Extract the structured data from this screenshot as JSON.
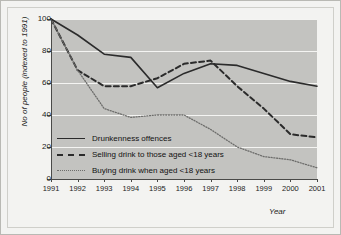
{
  "chart_data": {
    "type": "line",
    "title": "",
    "xlabel": "Year",
    "ylabel": "No of people (indexed to 1991)",
    "categories": [
      "1991",
      "1992",
      "1993",
      "1994",
      "1995",
      "1996",
      "1997",
      "1998",
      "1999",
      "2000",
      "2001"
    ],
    "x": [
      1991,
      1992,
      1993,
      1994,
      1995,
      1996,
      1997,
      1998,
      1999,
      2000,
      2001
    ],
    "xlim": [
      1991,
      2001
    ],
    "ylim": [
      0,
      100
    ],
    "yticks": [
      0,
      20,
      40,
      60,
      80,
      100
    ],
    "grid": true,
    "legend_position": "inside-lower-left",
    "series": [
      {
        "name": "Drunkenness offences",
        "style": "solid",
        "color": "#2b2b2b",
        "values": [
          100,
          90,
          78,
          76,
          57,
          66,
          72,
          71,
          66,
          61,
          58
        ]
      },
      {
        "name": "Selling drink to those aged <18 years",
        "style": "dashed",
        "color": "#2b2b2b",
        "values": [
          100,
          68,
          58,
          58,
          63,
          72,
          74,
          58,
          44,
          28,
          26
        ]
      },
      {
        "name": "Buying drink when aged <18 years",
        "style": "dotted",
        "color": "#6d6d6b",
        "values": [
          100,
          68,
          44,
          38.5,
          40,
          40,
          31,
          20,
          14,
          12,
          7
        ]
      }
    ]
  },
  "axes": {
    "y_title": "No of people (indexed to 1991)",
    "x_title": "Year",
    "y_tick_labels": [
      "100",
      "80",
      "60",
      "40",
      "20",
      "0"
    ],
    "x_tick_labels": [
      "1991",
      "1992",
      "1993",
      "1994",
      "1995",
      "1996",
      "1997",
      "1998",
      "1999",
      "2000",
      "2001"
    ]
  },
  "legend": {
    "items": [
      {
        "label": "Drunkenness offences",
        "style": "solid"
      },
      {
        "label": "Selling drink to those aged <18 years",
        "style": "dashed"
      },
      {
        "label": "Buying drink when aged <18 years",
        "style": "dotted"
      }
    ]
  },
  "colors": {
    "figure_background": "#f3f3f1",
    "plot_background": "#c3c3c0",
    "gridline": "#f4f4f2",
    "axis": "#4a4a48",
    "series_dark": "#2b2b2b",
    "series_light": "#6d6d6b",
    "text": "#1c1c1c"
  }
}
